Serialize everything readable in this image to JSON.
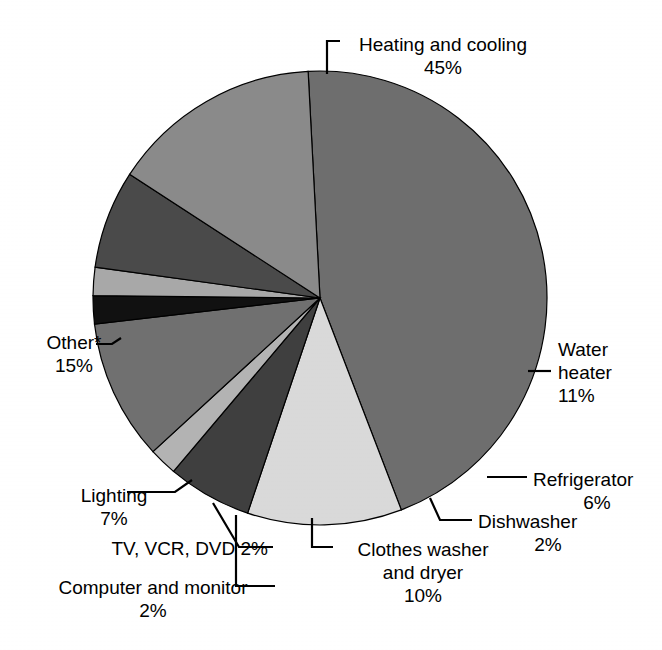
{
  "chart_data": {
    "type": "pie",
    "title": "",
    "subtitle": "",
    "xlabel": "",
    "ylabel": "",
    "legend_position": "none",
    "grid": false,
    "units": "percent",
    "footnote_marker": "*",
    "start_angle_deg": -3,
    "direction": "clockwise",
    "categories": [
      "Heating and cooling",
      "Water heater",
      "Refrigerator",
      "Dishwasher",
      "Clothes washer and dryer",
      "Computer and monitor",
      "TV, VCR, DVD",
      "Lighting",
      "Other*"
    ],
    "values": [
      45,
      11,
      6,
      2,
      10,
      2,
      2,
      7,
      15
    ],
    "value_labels": [
      "45%",
      "11%",
      "6%",
      "2%",
      "10%",
      "2%",
      "2%",
      "7%",
      "15%"
    ],
    "colors": [
      "#6e6e6e",
      "#d9d9d9",
      "#3f3f3f",
      "#b3b3b3",
      "#707070",
      "#111111",
      "#a8a8a8",
      "#4a4a4a",
      "#8a8a8a"
    ],
    "slices": [
      {
        "label": "Heating and cooling",
        "value": 45,
        "value_label": "45%",
        "color": "#6e6e6e"
      },
      {
        "label": "Water heater",
        "value": 11,
        "value_label": "11%",
        "color": "#d9d9d9"
      },
      {
        "label": "Refrigerator",
        "value": 6,
        "value_label": "6%",
        "color": "#3f3f3f"
      },
      {
        "label": "Dishwasher",
        "value": 2,
        "value_label": "2%",
        "color": "#b3b3b3"
      },
      {
        "label": "Clothes washer and dryer",
        "value": 10,
        "value_label": "10%",
        "color": "#707070"
      },
      {
        "label": "Computer and monitor",
        "value": 2,
        "value_label": "2%",
        "color": "#111111"
      },
      {
        "label": "TV, VCR, DVD",
        "value": 2,
        "value_label": "2%",
        "color": "#a8a8a8"
      },
      {
        "label": "Lighting",
        "value": 7,
        "value_label": "7%",
        "color": "#4a4a4a"
      },
      {
        "label": "Other*",
        "value": 15,
        "value_label": "15%",
        "color": "#8a8a8a"
      }
    ]
  },
  "labels": {
    "heating": {
      "line1": "Heating and cooling",
      "line2": "45%"
    },
    "water": {
      "line1": "Water",
      "line2": "heater",
      "line3": "11%"
    },
    "refrigerator": {
      "line1": "Refrigerator",
      "line2": "6%"
    },
    "dishwasher": {
      "line1": "Dishwasher",
      "line2": "2%"
    },
    "clothes": {
      "line1": "Clothes washer",
      "line2": "and dryer",
      "line3": "10%"
    },
    "computer": {
      "line1": "Computer and monitor",
      "line2": "2%"
    },
    "tv": {
      "line1": "TV, VCR, DVD 2%"
    },
    "lighting": {
      "line1": "Lighting",
      "line2": "7%"
    },
    "other": {
      "line1": "Other*",
      "line2": "15%"
    }
  },
  "style": {
    "background": "#ffffff",
    "text_color": "#000000",
    "leader_line_color": "#000000",
    "slice_outline_color": "#000000"
  }
}
